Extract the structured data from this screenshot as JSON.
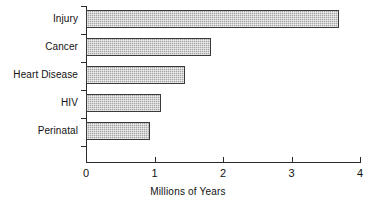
{
  "chart_data": {
    "type": "bar",
    "orientation": "horizontal",
    "title": "",
    "xlabel": "Millions of Years",
    "ylabel": "",
    "categories": [
      "Injury",
      "Cancer",
      "Heart Disease",
      "HIV",
      "Perinatal"
    ],
    "values": [
      3.7,
      1.83,
      1.45,
      1.1,
      0.93
    ],
    "series": [
      {
        "name": "Millions of Years",
        "values": [
          3.7,
          1.83,
          1.45,
          1.1,
          0.93
        ]
      }
    ],
    "xlim": [
      0,
      4
    ],
    "xticks": [
      0,
      1,
      2,
      3,
      4
    ],
    "xtick_labels": [
      "0",
      "1",
      "2",
      "3",
      "4"
    ],
    "grid": false,
    "legend": false,
    "legend_position": "none",
    "bar_fill_color": "#a6a6a6",
    "bar_edge_color": "#3a3a3a",
    "axis_color": "#2b2b2b",
    "background_color": "#ffffff"
  },
  "axes": {
    "x_title": "Millions of Years"
  }
}
